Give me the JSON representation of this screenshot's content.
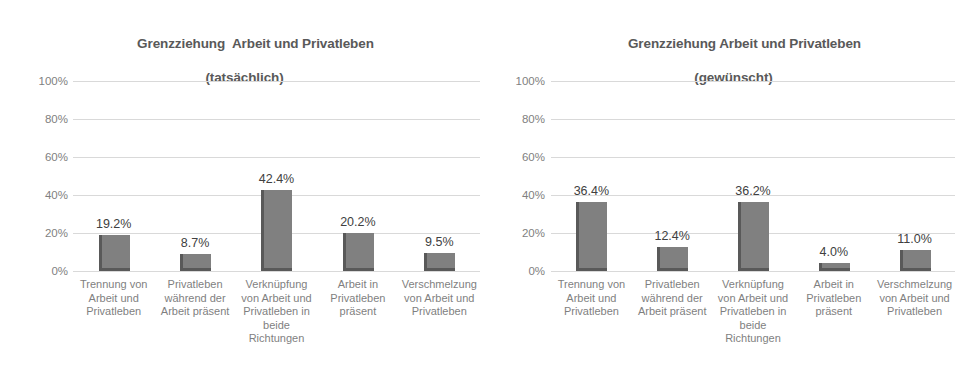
{
  "figure": {
    "background": "#ffffff",
    "bar_color": "#808080",
    "bar_shadow_color": "#595959",
    "gridline_color": "#d9d9d9",
    "axis_text_color": "#7f7f7f",
    "title_color": "#595959",
    "label_color": "#404040"
  },
  "chart_data": [
    {
      "type": "bar",
      "title": "Grenzziehung  Arbeit und Privatleben",
      "subtitle": "(tatsächlich)",
      "xlabel": "",
      "ylabel": "",
      "ylim": [
        0,
        100
      ],
      "yticks": [
        "0%",
        "20%",
        "40%",
        "60%",
        "80%",
        "100%"
      ],
      "ytick_values": [
        0,
        20,
        40,
        60,
        80,
        100
      ],
      "grid": true,
      "legend": "none",
      "categories": [
        "Trennung von Arbeit und Privatleben",
        "Privatleben während der Arbeit präsent",
        "Verknüpfung von Arbeit und Privatleben in beide Richtungen",
        "Arbeit in Privatleben präsent",
        "Verschmelzung von Arbeit und Privatleben"
      ],
      "category_lines": [
        [
          "Trennung von",
          "Arbeit und",
          "Privatleben"
        ],
        [
          "Privatleben",
          "während der",
          "Arbeit präsent"
        ],
        [
          "Verknüpfung",
          "von Arbeit und",
          "Privatleben in",
          "beide",
          "Richtungen"
        ],
        [
          "Arbeit in",
          "Privatleben",
          "präsent"
        ],
        [
          "Verschmelzung",
          "von Arbeit und",
          "Privatleben"
        ]
      ],
      "values": [
        19.2,
        8.7,
        42.4,
        20.2,
        9.5
      ],
      "data_labels": [
        "19.2%",
        "8.7%",
        "42.4%",
        "20.2%",
        "9.5%"
      ]
    },
    {
      "type": "bar",
      "title": "Grenzziehung Arbeit und Privatleben",
      "subtitle": "(gewünscht)",
      "xlabel": "",
      "ylabel": "",
      "ylim": [
        0,
        100
      ],
      "yticks": [
        "0%",
        "20%",
        "40%",
        "60%",
        "80%",
        "100%"
      ],
      "ytick_values": [
        0,
        20,
        40,
        60,
        80,
        100
      ],
      "grid": true,
      "legend": "none",
      "categories": [
        "Trennung von Arbeit und Privatleben",
        "Privatleben während der Arbeit präsent",
        "Verknüpfung von Arbeit und Privatleben in beide Richtungen",
        "Arbeit in Privatleben präsent",
        "Verschmelzung von Arbeit und Privatleben"
      ],
      "category_lines": [
        [
          "Trennung von",
          "Arbeit und",
          "Privatleben"
        ],
        [
          "Privatleben",
          "während der",
          "Arbeit präsent"
        ],
        [
          "Verknüpfung",
          "von Arbeit und",
          "Privatleben in",
          "beide",
          "Richtungen"
        ],
        [
          "Arbeit in",
          "Privatleben",
          "präsent"
        ],
        [
          "Verschmelzung",
          "von Arbeit und",
          "Privatleben"
        ]
      ],
      "values": [
        36.4,
        12.4,
        36.2,
        4.0,
        11.0
      ],
      "data_labels": [
        "36.4%",
        "12.4%",
        "36.2%",
        "4.0%",
        "11.0%"
      ]
    }
  ]
}
